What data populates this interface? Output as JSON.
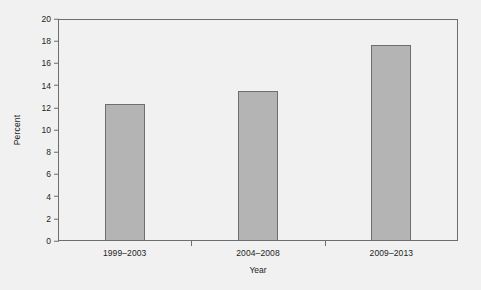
{
  "chart_data": {
    "type": "bar",
    "title": "",
    "subtitle": "",
    "xlabel": "Year",
    "ylabel": "Percent",
    "categories": [
      "1999–2003",
      "2004–2008",
      "2009–2013"
    ],
    "values": [
      12.3,
      13.5,
      17.7
    ],
    "series": [
      {
        "name": "Percent",
        "values": [
          12.3,
          13.5,
          17.7
        ]
      }
    ],
    "ylim": [
      0,
      20
    ],
    "yticks": [
      0,
      2,
      4,
      6,
      8,
      10,
      12,
      14,
      16,
      18,
      20
    ],
    "ytick_labels": [
      "0",
      "2",
      "4",
      "6",
      "8",
      "10",
      "12",
      "14",
      "16",
      "18",
      "20"
    ],
    "grid": false,
    "legend": null,
    "legend_position": "none",
    "annotations": [],
    "colors": {
      "bar_fill": "#b4b4b4",
      "bar_edge": "#6e6e6e",
      "axis": "#6e6e6e",
      "text": "#1d1d1d",
      "background": "#f1f1f1"
    }
  }
}
